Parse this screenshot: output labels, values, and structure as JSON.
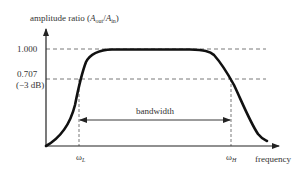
{
  "diagram": {
    "type": "bandpass-frequency-response",
    "y_axis_label": {
      "prefix": "amplitude ratio (",
      "A1": "A",
      "sub1": "out",
      "slash": "/",
      "A2": "A",
      "sub2": "in",
      "suffix": ")"
    },
    "x_axis_label": "frequency",
    "y_ticks": [
      {
        "label": "1.000",
        "value": 1.0
      },
      {
        "label": "0.707",
        "value": 0.707,
        "note": "(−3 dB)"
      }
    ],
    "x_markers": [
      {
        "symbol": "ω",
        "sub": "L"
      },
      {
        "symbol": "ω",
        "sub": "H"
      }
    ],
    "bandwidth_label": "bandwidth",
    "colors": {
      "curve": "#111111",
      "axes": "#222222",
      "dashed": "#555555",
      "text": "#333333"
    }
  }
}
